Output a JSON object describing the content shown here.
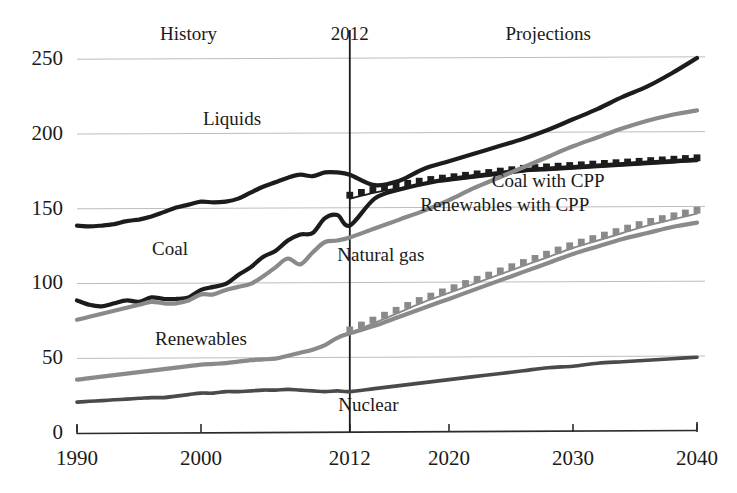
{
  "chart_data": {
    "type": "line",
    "title": "",
    "xlabel": "",
    "ylabel": "",
    "xlim": [
      1990,
      2040
    ],
    "ylim": [
      0,
      260
    ],
    "grid": "horizontal",
    "legend_position": "inline-labels",
    "x_ticks": [
      "1990",
      "2000",
      "2012",
      "2020",
      "2030",
      "2040"
    ],
    "x_tick_values": [
      1990,
      2000,
      2012,
      2020,
      2030,
      2040
    ],
    "y_ticks": [
      "0",
      "50",
      "100",
      "150",
      "200",
      "250"
    ],
    "y_tick_values": [
      0,
      50,
      100,
      150,
      200,
      250
    ],
    "divider_year": 2012,
    "annotations": [
      {
        "name": "history",
        "text": "History",
        "x": 1999,
        "y": 262
      },
      {
        "name": "divider-year",
        "text": "2012",
        "x": 2012,
        "y": 262
      },
      {
        "name": "projections",
        "text": "Projections",
        "x": 2028,
        "y": 262
      }
    ],
    "series": [
      {
        "name": "Liquids",
        "label": "Liquids",
        "label_x": 2002.5,
        "label_y": 205,
        "color": "#1c1c1c",
        "width": 4.2,
        "style": "solid",
        "x": [
          1990,
          1991,
          1992,
          1993,
          1994,
          1995,
          1996,
          1997,
          1998,
          1999,
          2000,
          2001,
          2002,
          2003,
          2004,
          2005,
          2006,
          2007,
          2008,
          2009,
          2010,
          2011,
          2012,
          2014,
          2016,
          2018,
          2020,
          2022,
          2024,
          2026,
          2028,
          2030,
          2032,
          2034,
          2036,
          2038,
          2040
        ],
        "values": [
          138,
          137.5,
          138,
          139,
          141,
          142,
          144,
          147,
          150,
          152,
          154,
          153.5,
          154,
          156,
          160,
          164,
          167,
          170,
          172,
          171,
          173.5,
          173.5,
          172,
          165,
          168,
          176,
          181,
          186,
          191,
          196,
          202,
          209,
          216,
          224,
          231,
          240,
          250
        ]
      },
      {
        "name": "Coal",
        "label": "Coal",
        "label_x": 1997.5,
        "label_y": 118,
        "color": "#1c1c1c",
        "width": 4.2,
        "style": "solid",
        "x": [
          1990,
          1991,
          1992,
          1993,
          1994,
          1995,
          1996,
          1997,
          1998,
          1999,
          2000,
          2001,
          2002,
          2003,
          2004,
          2005,
          2006,
          2007,
          2008,
          2009,
          2010,
          2011,
          2012,
          2014,
          2016,
          2018,
          2020,
          2022,
          2024,
          2026,
          2028,
          2030,
          2032,
          2034,
          2036,
          2038,
          2040
        ],
        "values": [
          88,
          85,
          84,
          86,
          88,
          87,
          90,
          89,
          89,
          90,
          95,
          97,
          99,
          105,
          110,
          117,
          121,
          128,
          132,
          133,
          143,
          145,
          138,
          156,
          162,
          166,
          169,
          171,
          173,
          175,
          176,
          177,
          178,
          179,
          180,
          181,
          182
        ]
      },
      {
        "name": "Coal with CPP",
        "label": "Coal with CPP",
        "label_x": 2028,
        "label_y": 164,
        "color": "#1c1c1c",
        "width": 3.4,
        "style": "square-markers",
        "x": [
          2012,
          2014,
          2016,
          2018,
          2020,
          2022,
          2024,
          2026,
          2028,
          2030,
          2032,
          2034,
          2036,
          2038,
          2040
        ],
        "values": [
          156,
          160,
          163,
          166,
          168,
          170,
          172,
          174,
          175,
          176,
          177,
          178,
          179,
          180,
          181
        ]
      },
      {
        "name": "Natural gas",
        "label": "Natural gas",
        "label_x": 2014.5,
        "label_y": 114,
        "color": "#8a8a8a",
        "width": 4.2,
        "style": "solid",
        "x": [
          1990,
          1991,
          1992,
          1993,
          1994,
          1995,
          1996,
          1997,
          1998,
          1999,
          2000,
          2001,
          2002,
          2003,
          2004,
          2005,
          2006,
          2007,
          2008,
          2009,
          2010,
          2011,
          2012,
          2014,
          2016,
          2018,
          2020,
          2022,
          2024,
          2026,
          2028,
          2030,
          2032,
          2034,
          2036,
          2038,
          2040
        ],
        "values": [
          75,
          77,
          79,
          81,
          83,
          85,
          87,
          86,
          86,
          88,
          92,
          92,
          95,
          97,
          99,
          104,
          110,
          116,
          112,
          120,
          127,
          128,
          130,
          136,
          142,
          148,
          155,
          163,
          170,
          177,
          184,
          191,
          197,
          203,
          208,
          212,
          215
        ]
      },
      {
        "name": "Renewables",
        "label": "Renewables",
        "label_x": 2000,
        "label_y": 58,
        "color": "#8a8a8a",
        "width": 4.2,
        "style": "solid",
        "x": [
          1990,
          1991,
          1992,
          1993,
          1994,
          1995,
          1996,
          1997,
          1998,
          1999,
          2000,
          2001,
          2002,
          2003,
          2004,
          2005,
          2006,
          2007,
          2008,
          2009,
          2010,
          2011,
          2012,
          2014,
          2016,
          2018,
          2020,
          2022,
          2024,
          2026,
          2028,
          2030,
          2032,
          2034,
          2036,
          2038,
          2040
        ],
        "values": [
          35,
          36,
          37,
          38,
          39,
          40,
          41,
          42,
          43,
          44,
          45,
          45.5,
          46,
          47,
          48,
          48.5,
          49,
          51,
          53,
          55,
          58,
          63,
          66,
          71,
          77,
          83,
          89,
          95,
          101,
          107,
          113,
          119,
          124,
          129,
          133,
          137,
          140
        ]
      },
      {
        "name": "Renewables with CPP",
        "label": "Renewables with CPP",
        "label_x": 2024.5,
        "label_y": 148,
        "color": "#8a8a8a",
        "width": 3.4,
        "style": "square-markers",
        "x": [
          2012,
          2014,
          2016,
          2018,
          2020,
          2022,
          2024,
          2026,
          2028,
          2030,
          2032,
          2034,
          2036,
          2038,
          2040
        ],
        "values": [
          66,
          73,
          80,
          87,
          93,
          99,
          105,
          111,
          117,
          123,
          128,
          133,
          138,
          142,
          146
        ]
      },
      {
        "name": "Nuclear",
        "label": "Nuclear",
        "label_x": 2013.5,
        "label_y": 14,
        "color": "#4a4a4a",
        "width": 3.6,
        "style": "solid",
        "x": [
          1990,
          1991,
          1992,
          1993,
          1994,
          1995,
          1996,
          1997,
          1998,
          1999,
          2000,
          2001,
          2002,
          2003,
          2004,
          2005,
          2006,
          2007,
          2008,
          2009,
          2010,
          2011,
          2012,
          2014,
          2016,
          2018,
          2020,
          2022,
          2024,
          2026,
          2028,
          2030,
          2032,
          2034,
          2036,
          2038,
          2040
        ],
        "values": [
          20,
          20.5,
          21,
          21.5,
          22,
          22.5,
          23,
          23,
          24,
          25,
          26,
          26,
          27,
          27,
          27.5,
          28,
          28,
          28.5,
          28,
          27.5,
          27,
          27.5,
          27,
          29,
          31,
          33,
          35,
          37,
          39,
          41,
          43,
          44,
          46,
          47,
          48,
          49,
          50
        ]
      }
    ]
  }
}
